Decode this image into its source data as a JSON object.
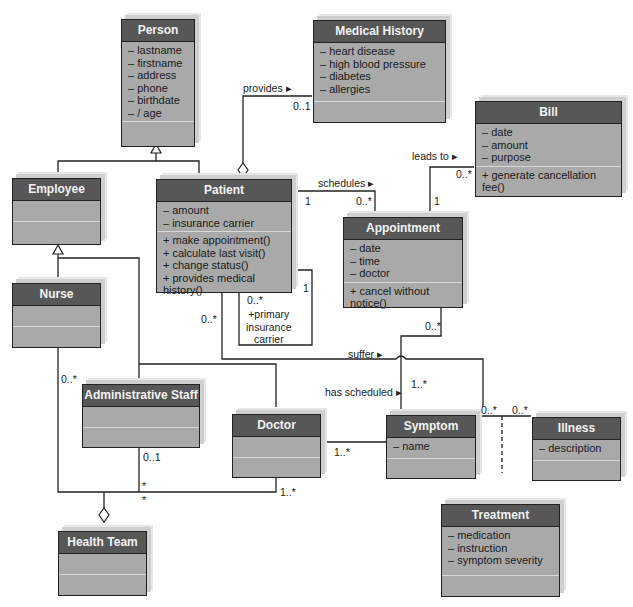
{
  "classes": {
    "person": {
      "name": "Person",
      "attributes": [
        "– lastname",
        "– firstname",
        "– address",
        "– phone",
        "– birthdate",
        "– / age"
      ],
      "operations": []
    },
    "medical_history": {
      "name": "Medical History",
      "attributes": [
        "– heart disease",
        "– high blood pressure",
        "– diabetes",
        "– allergies"
      ],
      "operations": []
    },
    "bill": {
      "name": "Bill",
      "attributes": [
        "– date",
        "– amount",
        "– purpose"
      ],
      "operations": [
        "+ generate cancellation fee()"
      ]
    },
    "employee": {
      "name": "Employee",
      "attributes": [],
      "operations": []
    },
    "patient": {
      "name": "Patient",
      "attributes": [
        "– amount",
        "– insurance carrier"
      ],
      "operations": [
        "+ make appointment()",
        "+ calculate last visit()",
        "+ change status()",
        "+ provides medical history()"
      ]
    },
    "appointment": {
      "name": "Appointment",
      "attributes": [
        "– date",
        "– time",
        "– doctor"
      ],
      "operations": [
        "+ cancel without notice()"
      ]
    },
    "nurse": {
      "name": "Nurse",
      "attributes": [],
      "operations": []
    },
    "administrative_staff": {
      "name": "Administrative Staff",
      "attributes": [],
      "operations": []
    },
    "doctor": {
      "name": "Doctor",
      "attributes": [],
      "operations": []
    },
    "symptom": {
      "name": "Symptom",
      "attributes": [
        "– name"
      ],
      "operations": []
    },
    "illness": {
      "name": "Illness",
      "attributes": [
        "– description"
      ],
      "operations": []
    },
    "treatment": {
      "name": "Treatment",
      "attributes": [
        "– medication",
        "– instruction",
        "– symptom severity"
      ],
      "operations": []
    },
    "health_team": {
      "name": "Health Team",
      "attributes": [],
      "operations": []
    }
  },
  "associations": {
    "provides": {
      "label": "provides ▸",
      "mult_target": "0..1"
    },
    "schedules": {
      "label": "schedules ▸",
      "mult_source": "1",
      "mult_target": "0..*"
    },
    "leads_to": {
      "label": "leads to ▸",
      "mult_source": "1",
      "mult_target": "0..*"
    },
    "primary_insurance": {
      "label": "+primary\ninsurance\ncarrier",
      "mult_source": "1",
      "mult_target": "0..*"
    },
    "suffer": {
      "label": "suffer ▸",
      "mult_source": "0..*",
      "mult_target": "1..*"
    },
    "has_scheduled": {
      "label": "has scheduled ▸",
      "mult_source": "0..*",
      "mult_target": "1..*"
    },
    "symptom_illness": {
      "mult_source": "0..*",
      "mult_target": "0..*"
    },
    "team_nurse": {
      "mult": "0..*"
    },
    "team_admin": {
      "mult": "0..1",
      "mult_team": "*"
    },
    "team_doctor": {
      "mult": "1..*",
      "mult_team": "*"
    }
  }
}
